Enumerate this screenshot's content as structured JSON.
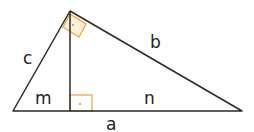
{
  "diagram": {
    "type": "right-triangle-altitude",
    "labels": {
      "c": "c",
      "b": "b",
      "m": "m",
      "n": "n",
      "a": "a"
    },
    "colors": {
      "line": "#2a2a2a",
      "right_angle_marker": "#f0a030",
      "right_angle_fill": "#fdf1d8"
    }
  }
}
